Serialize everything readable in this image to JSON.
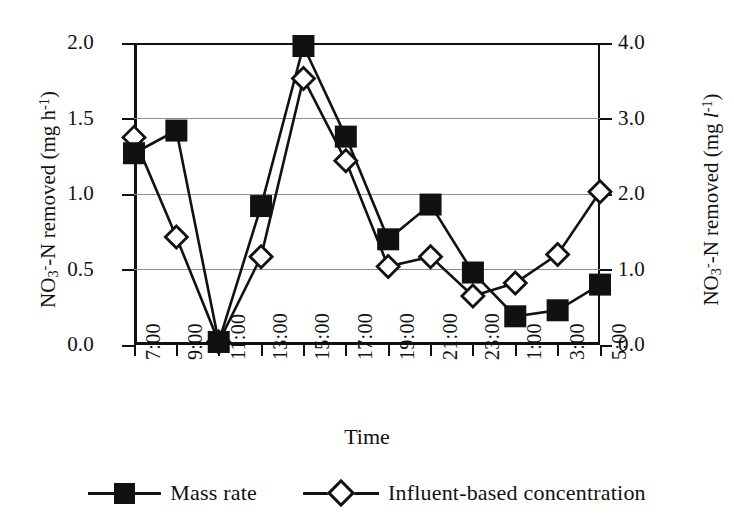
{
  "chart_data": {
    "type": "line",
    "title": "",
    "xlabel": "Time",
    "categories": [
      "7:00",
      "9:00",
      "11:00",
      "13:00",
      "15:00",
      "17:00",
      "19:00",
      "21:00",
      "23:00",
      "1:00",
      "3:00",
      "5:00"
    ],
    "series": [
      {
        "name": "Mass rate",
        "axis": "left",
        "marker": "filled-square",
        "values": [
          1.27,
          1.42,
          0.02,
          0.92,
          1.98,
          1.38,
          0.7,
          0.93,
          0.48,
          0.19,
          0.23,
          0.4
        ]
      },
      {
        "name": "Influent-based concentration",
        "axis": "right",
        "marker": "open-diamond",
        "values": [
          2.75,
          1.43,
          0.04,
          1.17,
          3.53,
          2.44,
          1.04,
          1.17,
          0.65,
          0.82,
          1.2,
          2.03
        ]
      }
    ],
    "left_axis": {
      "label_html": "NO<sub>3</sub><sup>-</sup>-N removed (mg h<sup>-1</sup>)",
      "label_text": "NO3--N removed (mg h-1)",
      "ticks": [
        "0.0",
        "0.5",
        "1.0",
        "1.5",
        "2.0"
      ],
      "tick_values": [
        0.0,
        0.5,
        1.0,
        1.5,
        2.0
      ],
      "ylim": [
        0.0,
        2.0
      ]
    },
    "right_axis": {
      "label_html": "NO<sub>3</sub><sup>-</sup>-N removed (mg <i>l</i><sup>-1</sup>)",
      "label_text": "NO3--N removed (mg l-1)",
      "ticks": [
        "0.0",
        "1.0",
        "2.0",
        "3.0",
        "4.0"
      ],
      "tick_values": [
        0.0,
        1.0,
        2.0,
        3.0,
        4.0
      ],
      "ylim": [
        0.0,
        4.0
      ]
    },
    "grid": true,
    "legend_position": "bottom",
    "colors": {
      "line": "#111111",
      "marker_fill_series1": "#111111",
      "marker_fill_series2": "#ffffff",
      "grid": "#8d8d8d",
      "background": "#ffffff"
    }
  },
  "legend": {
    "entries": [
      {
        "label": "Mass rate",
        "marker": "filled-square-icon"
      },
      {
        "label": "Influent-based concentration",
        "marker": "open-diamond-icon"
      }
    ]
  }
}
